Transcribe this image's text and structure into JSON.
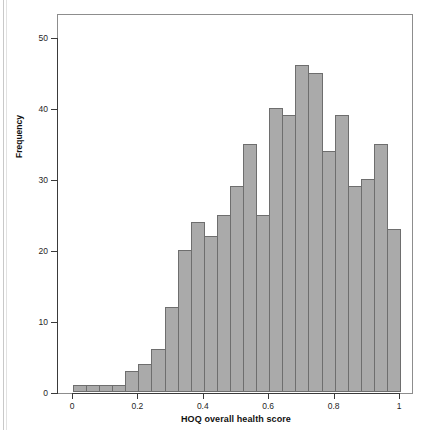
{
  "figure": {
    "background_color": "#ffffff",
    "frame_color": "#8d8d8d",
    "axis_color": "#3a3a3a",
    "bar_fill_color": "#aaaaaa",
    "bar_edge_color": "#6e6e6e"
  },
  "axes": {
    "x_title": "HOQ overall health score",
    "y_title": "Frequency",
    "x_ticklabels": [
      "0",
      "0.2",
      "0.4",
      "0.6",
      "0.8",
      "1"
    ],
    "x_tickvalues": [
      0,
      0.2,
      0.4,
      0.6,
      0.8,
      1
    ],
    "y_ticklabels": [
      "0",
      "10",
      "20",
      "30",
      "40",
      "50"
    ],
    "y_tickvalues": [
      0,
      10,
      20,
      30,
      40,
      50
    ]
  },
  "chart_data": {
    "type": "bar",
    "title": "",
    "subtitle": "",
    "xlabel": "HOQ overall health score",
    "ylabel": "Frequency",
    "xlim": [
      0,
      1
    ],
    "ylim": [
      0,
      52
    ],
    "grid": false,
    "legend": null,
    "bin_width": 0.04,
    "bin_count": 25,
    "bin_edges": [
      0,
      0.04,
      0.08,
      0.12,
      0.16,
      0.2,
      0.24,
      0.28,
      0.32,
      0.36,
      0.4,
      0.44,
      0.48,
      0.52,
      0.56,
      0.6,
      0.64,
      0.68,
      0.72,
      0.76,
      0.8,
      0.84,
      0.88,
      0.92,
      0.96,
      1.0
    ],
    "categories": [
      "0.00-0.04",
      "0.04-0.08",
      "0.08-0.12",
      "0.12-0.16",
      "0.16-0.20",
      "0.20-0.24",
      "0.24-0.28",
      "0.28-0.32",
      "0.32-0.36",
      "0.36-0.40",
      "0.40-0.44",
      "0.44-0.48",
      "0.48-0.52",
      "0.52-0.56",
      "0.56-0.60",
      "0.60-0.64",
      "0.64-0.68",
      "0.68-0.72",
      "0.72-0.76",
      "0.76-0.80",
      "0.80-0.84",
      "0.84-0.88",
      "0.88-0.92",
      "0.92-0.96",
      "0.96-1.00"
    ],
    "values": [
      1,
      1,
      1,
      1,
      3,
      4,
      6,
      12,
      20,
      24,
      22,
      25,
      29,
      35,
      25,
      40,
      39,
      46,
      45,
      34,
      39,
      29,
      30,
      35,
      23
    ]
  },
  "caption_sliver": ""
}
